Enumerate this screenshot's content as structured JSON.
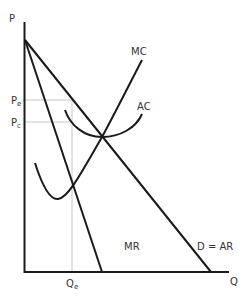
{
  "colors": {
    "curve": "#1a1a1a",
    "guide": "#c8c8c8",
    "text": "#333333",
    "background": "#ffffff"
  },
  "axes": {
    "y_label": "P",
    "x_label": "Q"
  },
  "levels": {
    "pe_label": "P",
    "pe_sub": "e",
    "pc_label": "P",
    "pc_sub": "c",
    "qe_label": "Q",
    "qe_sub": "e"
  },
  "curves": {
    "mc_label": "MC",
    "ac_label": "AC",
    "mr_label": "MR",
    "demand_label": "D = AR"
  }
}
